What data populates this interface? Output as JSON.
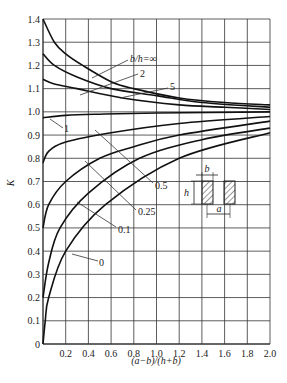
{
  "chart_data": {
    "type": "line",
    "title": "",
    "xlabel": "(a−b)/(h+b)",
    "ylabel": "K",
    "xlim": [
      0,
      2.0
    ],
    "ylim": [
      0,
      1.4
    ],
    "grid": true,
    "legend_position": "inline curve labels",
    "x_ticks": [
      "0.2",
      "0.4",
      "0.6",
      "0.8",
      "1.0",
      "1.2",
      "1.4",
      "1.6",
      "1.8",
      "2.0"
    ],
    "y_ticks": [
      "0",
      "0.1",
      "0.2",
      "0.3",
      "0.4",
      "0.5",
      "0.6",
      "0.7",
      "0.8",
      "0.9",
      "1.0",
      "1.1",
      "1.2",
      "1.3",
      "1.4"
    ],
    "series": [
      {
        "name": "b/h=∞",
        "label": "b/h=∞",
        "x": [
          0,
          0.1,
          0.2,
          0.35,
          0.6,
          0.8,
          1.2,
          1.6,
          2.0
        ],
        "values": [
          1.4,
          1.3,
          1.25,
          1.2,
          1.13,
          1.1,
          1.06,
          1.04,
          1.03
        ]
      },
      {
        "name": "2",
        "label": "2",
        "x": [
          0,
          0.1,
          0.3,
          0.6,
          1.0,
          1.4,
          2.0
        ],
        "values": [
          1.25,
          1.2,
          1.15,
          1.1,
          1.07,
          1.04,
          1.02
        ]
      },
      {
        "name": "5",
        "label": "5",
        "x": [
          0,
          0.1,
          0.3,
          0.7,
          1.2,
          1.6,
          2.0
        ],
        "values": [
          1.14,
          1.12,
          1.1,
          1.06,
          1.03,
          1.02,
          1.01
        ]
      },
      {
        "name": "1",
        "label": "1",
        "x": [
          0,
          0.2,
          0.5,
          1.0,
          2.0
        ],
        "values": [
          0.975,
          0.985,
          0.99,
          0.995,
          1.0
        ]
      },
      {
        "name": "0.5",
        "label": "0.5",
        "x": [
          0,
          0.05,
          0.2,
          0.6,
          1.2,
          2.0
        ],
        "values": [
          0.78,
          0.83,
          0.87,
          0.91,
          0.95,
          0.98
        ]
      },
      {
        "name": "0.25",
        "label": "0.25",
        "x": [
          0,
          0.05,
          0.2,
          0.5,
          0.8,
          1.2,
          2.0
        ],
        "values": [
          0.5,
          0.6,
          0.7,
          0.8,
          0.85,
          0.9,
          0.96
        ]
      },
      {
        "name": "0.1",
        "label": "0.1",
        "x": [
          0,
          0.05,
          0.15,
          0.4,
          0.85,
          1.4,
          2.0
        ],
        "values": [
          0.2,
          0.35,
          0.5,
          0.65,
          0.8,
          0.88,
          0.93
        ]
      },
      {
        "name": "0",
        "label": "0",
        "x": [
          0,
          0.02,
          0.05,
          0.2,
          0.55,
          1.2,
          2.0
        ],
        "values": [
          0,
          0.1,
          0.2,
          0.4,
          0.6,
          0.8,
          0.91
        ]
      }
    ],
    "annotations": [
      "b",
      "h",
      "a"
    ]
  },
  "figure": {
    "inset": {
      "b_label": "b",
      "h_label": "h",
      "a_label": "a"
    }
  }
}
